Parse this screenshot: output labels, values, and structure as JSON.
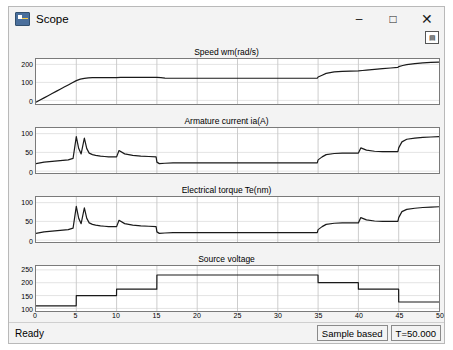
{
  "window": {
    "title": "Scope",
    "app_icon": "scope-icon",
    "minimize": "–",
    "maximize": "□",
    "close": "✕",
    "toolbar_icon": "cursor-measurement-icon"
  },
  "statusbar": {
    "ready": "Ready",
    "sample_mode": "Sample based",
    "time": "T=50.000"
  },
  "chart_data": [
    {
      "type": "line",
      "title": "Speed wm(rad/s)",
      "xlabel": "",
      "ylabel": "",
      "xlim": [
        0,
        50
      ],
      "ylim": [
        -20,
        230
      ],
      "xticks": [
        0,
        5,
        10,
        15,
        20,
        25,
        30,
        35,
        40,
        45,
        50
      ],
      "yticks": [
        0,
        100,
        200
      ],
      "grid": true,
      "color": "#1a1a1a",
      "x": [
        0,
        0.5,
        1,
        1.5,
        2,
        2.5,
        3,
        3.5,
        4,
        4.5,
        5,
        5.5,
        6,
        6.5,
        7,
        7.5,
        8,
        8.5,
        9,
        9.5,
        10,
        10.5,
        11,
        12,
        13,
        14,
        15,
        15.5,
        16,
        17,
        18,
        20,
        25,
        30,
        34.9,
        35,
        35.5,
        36,
        37,
        38,
        39,
        40,
        40.5,
        41,
        42,
        43,
        44,
        44.9,
        45,
        45.5,
        46,
        47,
        48,
        49,
        50
      ],
      "y": [
        -10,
        2,
        14,
        26,
        38,
        50,
        62,
        74,
        86,
        98,
        110,
        118,
        122,
        125,
        126,
        127,
        127,
        127,
        127,
        127,
        127,
        128,
        128,
        128,
        128,
        128,
        128,
        126,
        124,
        123,
        123,
        123,
        123,
        123,
        123,
        130,
        140,
        150,
        158,
        161,
        163,
        164,
        166,
        168,
        172,
        176,
        180,
        183,
        188,
        194,
        199,
        204,
        208,
        211,
        213
      ]
    },
    {
      "type": "line",
      "title": "Armature current ia(A)",
      "xlabel": "",
      "ylabel": "",
      "xlim": [
        0,
        50
      ],
      "ylim": [
        -5,
        115
      ],
      "xticks": [
        0,
        5,
        10,
        15,
        20,
        25,
        30,
        35,
        40,
        45,
        50
      ],
      "yticks": [
        0,
        50,
        100
      ],
      "grid": true,
      "color": "#1a1a1a",
      "x": [
        0,
        0.5,
        1,
        2,
        3,
        4,
        4.6,
        5,
        5.3,
        5.6,
        6,
        6.3,
        6.6,
        7,
        7.4,
        8,
        8.5,
        9,
        10,
        10.3,
        11,
        12,
        13,
        14,
        14.9,
        15,
        15.3,
        16,
        17,
        20,
        25,
        30,
        34.9,
        35,
        35.5,
        36,
        37,
        38,
        39,
        40,
        40.3,
        41,
        42,
        43,
        44,
        44.9,
        45,
        45.4,
        46,
        47,
        48,
        49,
        50
      ],
      "y": [
        20,
        22,
        24,
        26,
        28,
        30,
        34,
        92,
        60,
        46,
        88,
        60,
        48,
        44,
        42,
        40,
        39,
        38,
        38,
        55,
        46,
        42,
        40,
        39,
        38,
        24,
        20,
        21,
        22,
        22,
        22,
        22,
        22,
        30,
        38,
        44,
        47,
        48,
        48,
        48,
        62,
        56,
        53,
        52,
        52,
        52,
        62,
        78,
        85,
        88,
        90,
        91,
        92
      ]
    },
    {
      "type": "line",
      "title": "Electrical torque Te(nm)",
      "xlabel": "",
      "ylabel": "",
      "xlim": [
        0,
        50
      ],
      "ylim": [
        -5,
        115
      ],
      "xticks": [
        0,
        5,
        10,
        15,
        20,
        25,
        30,
        35,
        40,
        45,
        50
      ],
      "yticks": [
        0,
        50,
        100
      ],
      "grid": true,
      "color": "#1a1a1a",
      "x": [
        0,
        0.5,
        1,
        2,
        3,
        4,
        4.6,
        5,
        5.3,
        5.6,
        6,
        6.3,
        6.6,
        7,
        7.4,
        8,
        8.5,
        9,
        10,
        10.3,
        11,
        12,
        13,
        14,
        14.9,
        15,
        15.3,
        16,
        17,
        20,
        25,
        30,
        34.9,
        35,
        35.5,
        36,
        37,
        38,
        39,
        40,
        40.3,
        41,
        42,
        43,
        44,
        44.9,
        45,
        45.4,
        46,
        47,
        48,
        49,
        50
      ],
      "y": [
        18,
        20,
        22,
        24,
        26,
        28,
        32,
        90,
        58,
        44,
        86,
        58,
        46,
        42,
        40,
        38,
        37,
        36,
        36,
        53,
        44,
        40,
        38,
        37,
        36,
        22,
        18,
        19,
        20,
        20,
        20,
        20,
        20,
        28,
        36,
        42,
        45,
        46,
        46,
        46,
        60,
        54,
        51,
        50,
        50,
        50,
        60,
        76,
        82,
        85,
        87,
        88,
        89
      ]
    },
    {
      "type": "line",
      "title": "Source voltage",
      "xlabel": "",
      "ylabel": "",
      "xlim": [
        0,
        50
      ],
      "ylim": [
        90,
        265
      ],
      "xticks": [
        0,
        5,
        10,
        15,
        20,
        25,
        30,
        35,
        40,
        45,
        50
      ],
      "yticks": [
        100,
        150,
        200,
        250
      ],
      "grid": true,
      "color": "#1a1a1a",
      "x": [
        0,
        4.99,
        5,
        9.99,
        10,
        14.99,
        15,
        34.99,
        35,
        39.99,
        40,
        44.99,
        45,
        50
      ],
      "y": [
        110,
        110,
        150,
        150,
        175,
        175,
        230,
        230,
        200,
        200,
        175,
        175,
        125,
        125
      ]
    }
  ]
}
